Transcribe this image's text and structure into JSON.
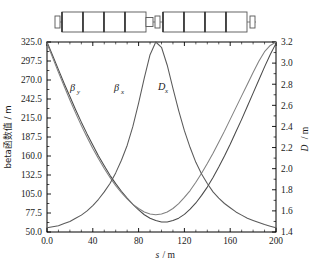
{
  "figure": {
    "name": "beta-function-dispersion-plot",
    "background": "#ffffff",
    "frame_color": "#000000"
  },
  "lattice": {
    "name": "accelerator-lattice-diagram",
    "element_fill": "#ffffff",
    "element_stroke": "#555555",
    "divider_color": "#333333",
    "elements": [
      {
        "type": "marker",
        "x": 55,
        "w": 5,
        "h": 12
      },
      {
        "type": "dipole",
        "x": 62,
        "w": 21,
        "h": 20
      },
      {
        "type": "dipole",
        "x": 83,
        "w": 21,
        "h": 20
      },
      {
        "type": "dipole",
        "x": 104,
        "w": 21,
        "h": 20
      },
      {
        "type": "dipole",
        "x": 125,
        "w": 21,
        "h": 20
      },
      {
        "type": "quadrupole",
        "x": 146,
        "w": 7,
        "h": 9
      },
      {
        "type": "marker",
        "x": 155,
        "w": 5,
        "h": 12
      },
      {
        "type": "dipole",
        "x": 163,
        "w": 21,
        "h": 20
      },
      {
        "type": "dipole",
        "x": 184,
        "w": 21,
        "h": 20
      },
      {
        "type": "dipole",
        "x": 205,
        "w": 21,
        "h": 20
      },
      {
        "type": "dipole",
        "x": 226,
        "w": 21,
        "h": 20
      },
      {
        "type": "marker",
        "x": 250,
        "w": 5,
        "h": 12
      }
    ]
  },
  "axes": {
    "left": {
      "title_cjk": "beta函数值",
      "title_unit": "/ m",
      "ticks": [
        "325.0",
        "297.5",
        "270.0",
        "242.5",
        "215.0",
        "187.5",
        "160.0",
        "132.5",
        "105.0",
        "77.5",
        "50.0"
      ],
      "min": 50.0,
      "max": 325.0,
      "step": 27.5
    },
    "right": {
      "title": "D",
      "title_unit": "/ m",
      "ticks": [
        "3.2",
        "3.0",
        "2.8",
        "2.6",
        "2.4",
        "2.2",
        "2.0",
        "1.8",
        "1.6",
        "1.4"
      ],
      "min": 1.4,
      "max": 3.2,
      "step": 0.2
    },
    "bottom": {
      "title": "s",
      "title_unit": "/ m",
      "ticks": [
        "0.0",
        "40",
        "80",
        "120",
        "160",
        "200"
      ],
      "min": 0,
      "max": 200,
      "step": 40
    }
  },
  "curve_labels": [
    {
      "base": "β",
      "sub": "y",
      "x": 70,
      "y": 55
    },
    {
      "base": "β",
      "sub": "x",
      "x": 114,
      "y": 55
    },
    {
      "base": "D",
      "sub": "x",
      "x": 158,
      "y": 54
    }
  ],
  "chart_data": {
    "type": "line",
    "title": "",
    "xlabel": "s/m",
    "ylabel": "beta函数值/m",
    "y2label": "D/m",
    "xlim": [
      0,
      200
    ],
    "ylim": [
      50.0,
      325.0
    ],
    "y2lim": [
      1.4,
      3.2
    ],
    "grid": false,
    "legend": "inline-annotations",
    "series": [
      {
        "name": "βy",
        "axis": "left",
        "color": "#4a4a4a",
        "x": [
          0,
          5,
          10,
          15,
          20,
          25,
          30,
          35,
          40,
          45,
          50,
          55,
          60,
          65,
          70,
          75,
          80,
          85,
          90,
          95,
          100,
          105,
          110,
          115,
          120,
          125,
          130,
          135,
          140,
          145,
          150,
          155,
          160,
          165,
          170,
          175,
          180,
          185,
          190,
          195,
          200
        ],
        "y": [
          325.0,
          305.0,
          285.0,
          265.0,
          246.0,
          227.0,
          209.0,
          192.0,
          176.0,
          160.0,
          146.0,
          132.0,
          120.0,
          109.0,
          99.0,
          90.0,
          82.0,
          75.0,
          70.0,
          66.5,
          64.5,
          64.5,
          66.5,
          70.0,
          75.5,
          83.0,
          92.0,
          103.0,
          115.0,
          129.0,
          144.0,
          160.0,
          177.0,
          195.0,
          213.0,
          232.0,
          251.0,
          270.0,
          289.0,
          307.0,
          323.0
        ]
      },
      {
        "name": "βx",
        "axis": "left",
        "color": "#808080",
        "x": [
          0,
          5,
          10,
          15,
          20,
          25,
          30,
          35,
          40,
          45,
          50,
          55,
          60,
          65,
          70,
          75,
          80,
          85,
          90,
          95,
          100,
          105,
          110,
          115,
          120,
          125,
          130,
          135,
          140,
          145,
          150,
          155,
          160,
          165,
          170,
          175,
          180,
          185,
          190,
          195,
          200
        ],
        "y": [
          323.0,
          302.0,
          281.0,
          261.0,
          241.0,
          222.0,
          204.0,
          187.0,
          171.0,
          156.0,
          142.0,
          129.0,
          117.0,
          107.0,
          98.0,
          90.0,
          84.0,
          79.0,
          76.0,
          75.0,
          76.0,
          79.0,
          84.0,
          91.0,
          100.0,
          110.0,
          122.0,
          135.0,
          149.0,
          164.0,
          180.0,
          196.0,
          213.0,
          230.0,
          247.0,
          264.0,
          281.0,
          297.0,
          311.0,
          320.0,
          325.0
        ]
      },
      {
        "name": "Dx",
        "axis": "right",
        "color": "#5a5a5a",
        "x": [
          0,
          5,
          10,
          15,
          20,
          25,
          30,
          35,
          40,
          45,
          50,
          55,
          60,
          65,
          70,
          75,
          80,
          85,
          90,
          95,
          100,
          105,
          110,
          115,
          120,
          125,
          130,
          135,
          140,
          145,
          150,
          155,
          160,
          165,
          170,
          175,
          180,
          185,
          190,
          195,
          200
        ],
        "y": [
          1.44,
          1.45,
          1.46,
          1.48,
          1.5,
          1.53,
          1.56,
          1.6,
          1.65,
          1.71,
          1.78,
          1.86,
          1.96,
          2.08,
          2.22,
          2.4,
          2.62,
          2.86,
          3.08,
          3.2,
          3.15,
          2.98,
          2.76,
          2.55,
          2.36,
          2.2,
          2.06,
          1.95,
          1.86,
          1.78,
          1.72,
          1.67,
          1.63,
          1.59,
          1.56,
          1.53,
          1.51,
          1.49,
          1.47,
          1.455,
          1.44
        ]
      }
    ]
  }
}
